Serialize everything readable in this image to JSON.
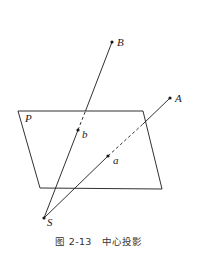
{
  "figure": {
    "caption_number": "图 2-13",
    "caption_title": "中心投影",
    "labels": {
      "plane": "P",
      "point_A": "A",
      "point_B": "B",
      "point_a": "a",
      "point_b": "b",
      "center": "S"
    },
    "colors": {
      "line": "#1a1a1a",
      "background": "#ffffff"
    }
  }
}
